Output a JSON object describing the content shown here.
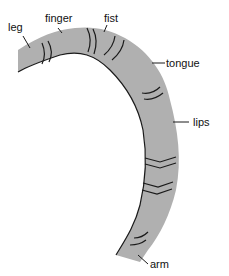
{
  "diagram": {
    "type": "cortical-strip-segment",
    "band_color": "#b0b0b0",
    "edge_color": "#1a1a1a",
    "labels": [
      {
        "id": "leg",
        "text": "leg"
      },
      {
        "id": "finger",
        "text": "finger"
      },
      {
        "id": "fist",
        "text": "fist"
      },
      {
        "id": "tongue",
        "text": "tongue"
      },
      {
        "id": "lips",
        "text": "lips"
      },
      {
        "id": "arm",
        "text": "arm"
      }
    ]
  }
}
